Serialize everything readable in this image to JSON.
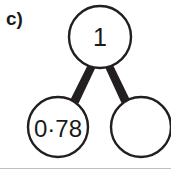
{
  "figure": {
    "item_label": "c)",
    "type": "part-whole-model",
    "background_color": "#ffffff",
    "stroke_color": "#231f20",
    "text_color": "#1a1a1a"
  },
  "whole": {
    "name": "whole-node",
    "value": "1",
    "filled": true,
    "center_x": 100,
    "center_y": 37,
    "radius": 31
  },
  "parts": [
    {
      "name": "part-node-left",
      "value": "0·78",
      "filled": true,
      "center_x": 58,
      "center_y": 127,
      "radius": 30
    },
    {
      "name": "part-node-right",
      "value": "",
      "filled": false,
      "center_x": 141,
      "center_y": 127,
      "radius": 30
    }
  ],
  "connectors": [
    {
      "name": "connector-left",
      "from": "whole-node",
      "to": "part-node-left"
    },
    {
      "name": "connector-right",
      "from": "whole-node",
      "to": "part-node-right"
    }
  ],
  "divider": {
    "name": "bottom-divider",
    "visible": true
  }
}
